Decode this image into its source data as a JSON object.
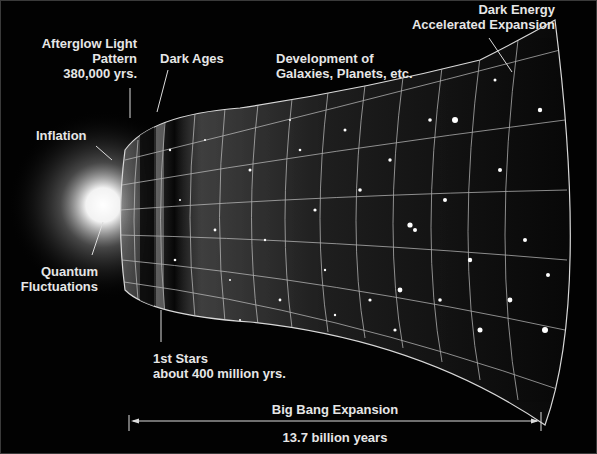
{
  "diagram": {
    "labels": {
      "afterglow": [
        "Afterglow Light",
        "Pattern",
        "380,000 yrs."
      ],
      "dark_ages": "Dark Ages",
      "development": [
        "Development of",
        "Galaxies, Planets, etc."
      ],
      "dark_energy": [
        "Dark Energy",
        "Accelerated Expansion"
      ],
      "inflation": "Inflation",
      "quantum": [
        "Quantum",
        "Fluctuations"
      ],
      "first_stars": [
        "1st Stars",
        "about 400 million yrs."
      ],
      "expansion": "Big Bang Expansion",
      "duration": "13.7 billion years"
    },
    "colors": {
      "background": "#020202",
      "text": "#e6e6e6",
      "grid": "#cfcfcf",
      "glow": "#ffffff"
    }
  }
}
